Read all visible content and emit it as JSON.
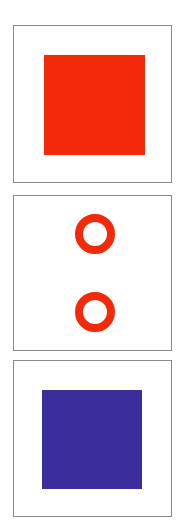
{
  "panels": [
    {
      "shape": "filled-square",
      "color": "#f22a0a"
    },
    {
      "shape": "two-rings",
      "color": "#f22a0a",
      "count": 2
    },
    {
      "shape": "filled-square",
      "color": "#3a2e9c"
    }
  ],
  "colors": {
    "red": "#f22a0a",
    "blue": "#3a2e9c",
    "border": "#8a8a8a",
    "background": "#ffffff"
  }
}
